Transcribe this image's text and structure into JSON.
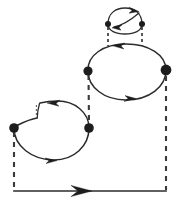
{
  "figure": {
    "background_color": "#ffffff",
    "stroke_color": "#2b2b2b",
    "dash_color": "#3a3a3a",
    "vertex_color": "#1d1d1d",
    "canvas": {
      "width": 178,
      "height": 209
    }
  },
  "loops": [
    {
      "id": "top-loop",
      "label": "top small loop",
      "shape": "ellipse",
      "center_x": 125,
      "center_y": 21,
      "radius_x": 19,
      "radius_y": 12,
      "arrow_outer_direction": "right",
      "arrow_inner_direction": "left"
    },
    {
      "id": "middle-loop",
      "label": "middle large loop",
      "shape": "ellipse",
      "center_x": 126,
      "center_y": 72,
      "radius_x": 40,
      "radius_y": 28,
      "arrow_top_direction": "left",
      "arrow_bottom_direction": "right"
    },
    {
      "id": "bottom-loop",
      "label": "bottom-left kidney loop",
      "shape": "kidney",
      "center_x": 51,
      "center_y": 131,
      "radius_x": 38,
      "radius_y": 27,
      "arrow_top_direction": "left",
      "arrow_bottom_direction": "right",
      "has_notch": true
    }
  ],
  "vertices": [
    {
      "id": "v-top-left",
      "label": "top loop left vertex",
      "x": 108,
      "y": 24,
      "r": 3.0
    },
    {
      "id": "v-top-right",
      "label": "top loop right vertex",
      "x": 142,
      "y": 24,
      "r": 3.0
    },
    {
      "id": "v-mid-left",
      "label": "middle loop left vertex",
      "x": 88,
      "y": 71,
      "r": 4.6
    },
    {
      "id": "v-mid-right",
      "label": "middle loop right vertex",
      "x": 166,
      "y": 70,
      "r": 5.4
    },
    {
      "id": "v-bottom-left",
      "label": "bottom loop left vertex",
      "x": 14,
      "y": 128,
      "r": 4.8
    },
    {
      "id": "v-bottom-right",
      "label": "bottom loop right vertex",
      "x": 89,
      "y": 128,
      "r": 4.8
    }
  ],
  "dashed_links": [
    {
      "id": "link-top-left",
      "label": "top-left dashed propagator",
      "x1": 108,
      "y1": 26,
      "x2": 108,
      "y2": 46,
      "weight": "thin"
    },
    {
      "id": "link-top-right",
      "label": "top-right dashed propagator",
      "x1": 142,
      "y1": 26,
      "x2": 142,
      "y2": 46,
      "weight": "thin"
    },
    {
      "id": "link-middle",
      "label": "middle vertical dashed propagator",
      "x1": 88,
      "y1": 74,
      "x2": 89,
      "y2": 125,
      "weight": "thick"
    },
    {
      "id": "link-left-leg",
      "label": "left dashed leg to base",
      "x1": 14,
      "y1": 131,
      "x2": 14,
      "y2": 190,
      "weight": "thick"
    },
    {
      "id": "link-right-leg",
      "label": "right dashed leg to base",
      "x1": 166,
      "y1": 74,
      "x2": 166,
      "y2": 190,
      "weight": "thick"
    }
  ],
  "base_line": {
    "id": "base-line",
    "label": "bottom external line",
    "x1": 14,
    "y1": 191,
    "x2": 166,
    "y2": 191,
    "arrow_x": 82,
    "arrow_direction": "right"
  },
  "arrows": [
    {
      "id": "arrow-top-outer",
      "label": "top loop outer arrow (rightward)"
    },
    {
      "id": "arrow-top-inner",
      "label": "top loop inner arrow (leftward)"
    },
    {
      "id": "arrow-mid-top",
      "label": "middle loop top arrow (leftward)"
    },
    {
      "id": "arrow-mid-bottom",
      "label": "middle loop bottom arrow (rightward)"
    },
    {
      "id": "arrow-bottom-top",
      "label": "bottom loop top arrow (leftward)"
    },
    {
      "id": "arrow-bottom-lower",
      "label": "bottom loop lower arrow (rightward)"
    },
    {
      "id": "arrow-base",
      "label": "base line arrow (rightward)"
    }
  ]
}
